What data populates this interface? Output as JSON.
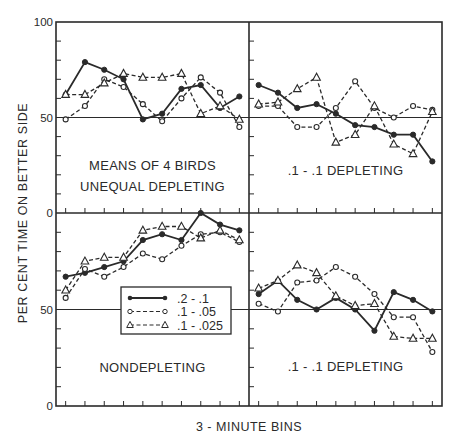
{
  "figure": {
    "ylabel": "PER CENT TIME ON BETTER SIDE",
    "xlabel": "3 - MINUTE BINS",
    "colors": {
      "ink": "#2a2a2a",
      "background": "#ffffff"
    }
  },
  "chart_data": [
    {
      "type": "line",
      "panel": "top-left",
      "title": "MEANS OF 4 BIRDS",
      "subtitle": "UNEQUAL DEPLETING",
      "xlabel": "3 - MINUTE BINS",
      "ylabel": "PER CENT TIME ON BETTER SIDE",
      "ylim": [
        0,
        100
      ],
      "yticks": [
        0,
        50,
        100
      ],
      "reference_line": 50,
      "x": [
        1,
        2,
        3,
        4,
        5,
        6,
        7,
        8,
        9,
        10
      ],
      "series": [
        {
          "name": ".2 - .1",
          "marker": "filled-circle",
          "line": "solid",
          "values": [
            62,
            79,
            75,
            70,
            49,
            52,
            65,
            67,
            55,
            61
          ]
        },
        {
          "name": ".1 - .05",
          "marker": "open-circle",
          "line": "dashed",
          "values": [
            49,
            56,
            70,
            66,
            57,
            48,
            60,
            71,
            63,
            45
          ]
        },
        {
          "name": ".1 - .025",
          "marker": "open-triangle",
          "line": "dashed",
          "values": [
            62,
            62,
            68,
            73,
            71,
            71,
            73,
            52,
            56,
            49
          ]
        }
      ]
    },
    {
      "type": "line",
      "panel": "top-right",
      "title": ".1 - .1 DEPLETING",
      "ylim": [
        0,
        100
      ],
      "reference_line": 50,
      "x": [
        1,
        2,
        3,
        4,
        5,
        6,
        7,
        8,
        9,
        10
      ],
      "series": [
        {
          "name": ".2 - .1",
          "marker": "filled-circle",
          "line": "solid",
          "values": [
            67,
            63,
            55,
            57,
            52,
            46,
            45,
            41,
            41,
            27
          ]
        },
        {
          "name": ".1 - .05",
          "marker": "open-circle",
          "line": "dashed",
          "values": [
            56,
            56,
            45,
            45,
            55,
            69,
            55,
            50,
            56,
            54
          ]
        },
        {
          "name": ".1 - .025",
          "marker": "open-triangle",
          "line": "dashed",
          "values": [
            57,
            58,
            65,
            71,
            37,
            41,
            56,
            36,
            31,
            53
          ]
        }
      ]
    },
    {
      "type": "line",
      "panel": "bottom-left",
      "title": "NONDEPLETING",
      "ylim": [
        0,
        100
      ],
      "yticks": [
        0,
        50,
        100
      ],
      "reference_line": 50,
      "x": [
        1,
        2,
        3,
        4,
        5,
        6,
        7,
        8,
        9,
        10
      ],
      "series": [
        {
          "name": ".2 - .1",
          "marker": "filled-circle",
          "line": "solid",
          "values": [
            67,
            69,
            72,
            75,
            86,
            89,
            86,
            100,
            94,
            91
          ]
        },
        {
          "name": ".1 - .05",
          "marker": "open-circle",
          "line": "dashed",
          "values": [
            56,
            71,
            67,
            72,
            79,
            76,
            83,
            89,
            90,
            85
          ]
        },
        {
          "name": ".1 - .025",
          "marker": "open-triangle",
          "line": "dashed",
          "values": [
            60,
            75,
            77,
            77,
            91,
            93,
            93,
            87,
            91,
            86
          ]
        }
      ],
      "legend": {
        "position": "inside-center-right",
        "entries": [
          ".2 - .1",
          ".1 - .05",
          ".1 - .025"
        ]
      }
    },
    {
      "type": "line",
      "panel": "bottom-right",
      "title": ".1 - .1 DEPLETING",
      "ylim": [
        0,
        100
      ],
      "reference_line": 50,
      "x": [
        1,
        2,
        3,
        4,
        5,
        6,
        7,
        8,
        9,
        10
      ],
      "series": [
        {
          "name": ".2 - .1",
          "marker": "filled-circle",
          "line": "solid",
          "values": [
            58,
            65,
            55,
            50,
            56,
            50,
            39,
            59,
            55,
            49
          ]
        },
        {
          "name": ".1 - .05",
          "marker": "open-circle",
          "line": "dashed",
          "values": [
            53,
            49,
            64,
            65,
            72,
            67,
            58,
            46,
            46,
            28
          ]
        },
        {
          "name": ".1 - .025",
          "marker": "open-triangle",
          "line": "dashed",
          "values": [
            61,
            65,
            73,
            69,
            57,
            52,
            53,
            36,
            35,
            35
          ]
        }
      ]
    }
  ],
  "layout": {
    "frame": {
      "left": 56,
      "right": 442,
      "top": 22,
      "mid_x": 249,
      "mid_y": 213,
      "bottom": 406
    },
    "ytick_labels": {
      "top": [
        "100",
        "50",
        "0"
      ],
      "bottom": [
        "50",
        "0"
      ]
    }
  }
}
